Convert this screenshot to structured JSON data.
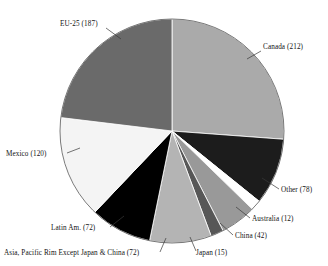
{
  "chart_data": {
    "type": "pie",
    "title": "",
    "subtitle": "",
    "xlabel": "",
    "ylabel": "",
    "legend_position": "none",
    "grid": false,
    "total": 810,
    "units": "",
    "start_angle_deg": 0,
    "direction": "clockwise",
    "categories": [
      "Canada",
      "Other",
      "Australia",
      "China",
      "Japan",
      "Asia, Pacific Rim Except Japan & China",
      "Latin Am.",
      "Mexico",
      "EU-25"
    ],
    "values": [
      212,
      78,
      12,
      42,
      15,
      72,
      72,
      120,
      187
    ],
    "labels": [
      "Canada (212)",
      "Other (78)",
      "Australia (12)",
      "China (42)",
      "Japan (15)",
      "Asia, Pacific Rim Except Japan & China (72)",
      "Latin Am. (72)",
      "Mexico (120)",
      "EU-25 (187)"
    ],
    "colors": [
      "#aaaaaa",
      "#1c1c1c",
      "#ffffff",
      "#999999",
      "#575757",
      "#b4b4b4",
      "#000000",
      "#f4f4f4",
      "#6a6a6a"
    ],
    "slices": [
      {
        "name": "Canada",
        "label": "Canada (212)",
        "value": 212,
        "color": "#aaaaaa",
        "label_x": 263,
        "label_y": 49,
        "anchor": "start",
        "leader": [
          [
            261,
            51
          ],
          [
            247,
            59
          ]
        ]
      },
      {
        "name": "Other",
        "label": "Other (78)",
        "value": 78,
        "color": "#1c1c1c",
        "label_x": 281,
        "label_y": 192,
        "anchor": "start",
        "leader": [
          [
            279,
            189
          ],
          [
            262,
            178
          ]
        ]
      },
      {
        "name": "Australia",
        "label": "Australia (12)",
        "value": 12,
        "color": "#ffffff",
        "label_x": 252,
        "label_y": 221,
        "anchor": "start",
        "leader": [
          [
            250,
            218
          ],
          [
            236,
            207
          ]
        ]
      },
      {
        "name": "China",
        "label": "China (42)",
        "value": 42,
        "color": "#999999",
        "label_x": 235,
        "label_y": 238,
        "anchor": "start",
        "leader": [
          [
            233,
            235
          ],
          [
            220,
            223
          ]
        ]
      },
      {
        "name": "Japan",
        "label": "Japan (15)",
        "value": 15,
        "color": "#575757",
        "label_x": 196,
        "label_y": 255,
        "anchor": "start",
        "leader": [
          [
            196,
            251
          ],
          [
            190,
            237
          ]
        ]
      },
      {
        "name": "Asia, Pacific Rim Except Japan & China",
        "label": "Asia, Pacific Rim Except Japan & China (72)",
        "value": 72,
        "color": "#b4b4b4",
        "label_x": 4,
        "label_y": 255,
        "anchor": "start",
        "leader": [
          [
            160,
            252
          ],
          [
            166,
            238
          ]
        ]
      },
      {
        "name": "Latin Am.",
        "label": "Latin Am. (72)",
        "value": 72,
        "color": "#000000",
        "label_x": 51,
        "label_y": 230,
        "anchor": "start",
        "leader": [
          [
            110,
            227
          ],
          [
            124,
            216
          ]
        ]
      },
      {
        "name": "Mexico",
        "label": "Mexico (120)",
        "value": 120,
        "color": "#f4f4f4",
        "label_x": 6,
        "label_y": 156,
        "anchor": "start",
        "leader": [
          [
            67,
            153
          ],
          [
            80,
            148
          ]
        ]
      },
      {
        "name": "EU-25",
        "label": "EU-25 (187)",
        "value": 187,
        "color": "#6a6a6a",
        "label_x": 60,
        "label_y": 26,
        "anchor": "start",
        "leader": [
          [
            106,
            28
          ],
          [
            121,
            39
          ]
        ]
      }
    ],
    "geometry": {
      "cx": 172,
      "cy": 131,
      "r": 112
    }
  }
}
